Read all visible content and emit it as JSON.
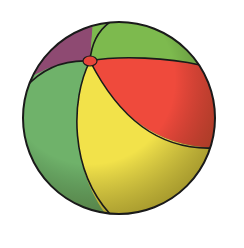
{
  "image": {
    "subject": "beach ball illustration",
    "background": "#ffffff"
  },
  "colors": {
    "outline": "#1a1a1a",
    "purple": "#8e4a72",
    "green_top": "#7dba4e",
    "red": "#ef4a3c",
    "yellow": "#f2e24a",
    "green_left": "#6fb26a",
    "valve": "#e8453a",
    "shadow": "#6b6a2a"
  }
}
